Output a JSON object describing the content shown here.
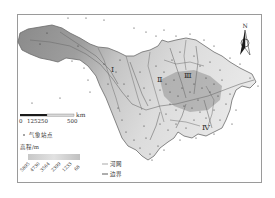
{
  "map": {
    "title": "",
    "north_arrow": {
      "label": "N"
    },
    "scale_bar": {
      "unit": "km",
      "ticks": [
        "0",
        "125",
        "250",
        "500"
      ],
      "tick_label_combined": "125250"
    },
    "region_labels": [
      "Ⅰ",
      "Ⅱ",
      "Ⅲ",
      "Ⅳ"
    ],
    "legend": {
      "stations_label": "气象站点",
      "elevation_title": "高程/m",
      "elevation_ticks": [
        "5895",
        "4730",
        "3564",
        "2399",
        "1233",
        "68"
      ],
      "river_label": "河网",
      "boundary_label": "边界"
    },
    "colors": {
      "basin_high": "#8a8a8a",
      "basin_mid": "#bdbdbd",
      "basin_low": "#e6e6e6",
      "stations": "#333333",
      "rivers": "#6e6e6e",
      "frame": "#9a9a9a"
    }
  }
}
